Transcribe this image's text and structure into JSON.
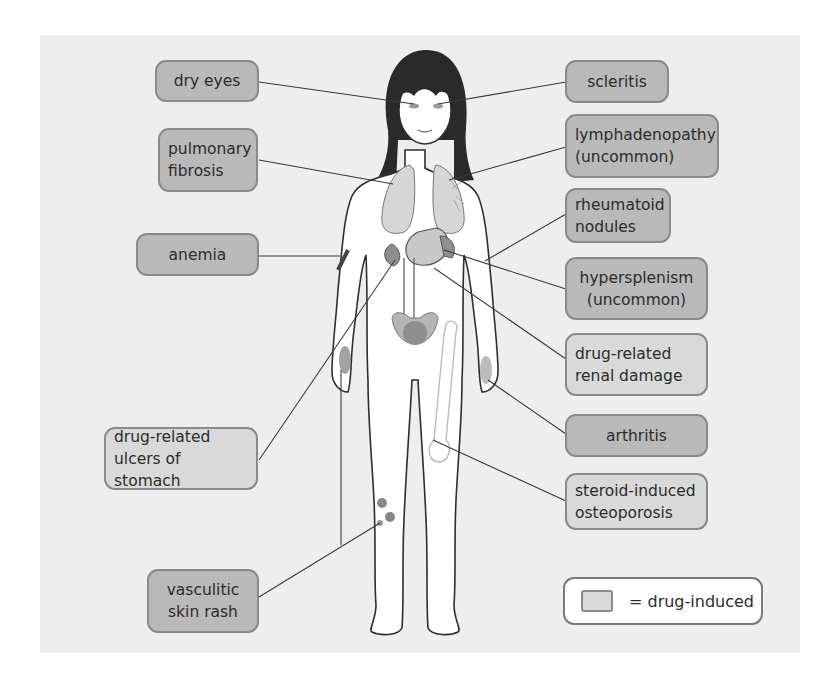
{
  "colors": {
    "background": "#ffffff",
    "panel": "#eeeeee",
    "disease_box": "#b9b9b9",
    "drug_induced_box": "#d9d9d9",
    "box_border": "#8a8a8a",
    "leader_line": "#3a3a3a",
    "organ_fill": "#c8c8c8",
    "organ_dark": "#8e8e8e",
    "hair": "#2a2a2a",
    "skin": "#ffffff"
  },
  "labels": {
    "dry_eyes": {
      "text": "dry eyes",
      "drug_induced": false
    },
    "pulmonary_fibrosis": {
      "text": "pulmonary\nfibrosis",
      "drug_induced": false
    },
    "anemia": {
      "text": "anemia",
      "drug_induced": false
    },
    "drug_related_ulcers": {
      "text": "drug-related\nulcers of stomach",
      "drug_induced": true
    },
    "vasculitic_skin_rash": {
      "text": "vasculitic\nskin rash",
      "drug_induced": false
    },
    "scleritis": {
      "text": "scleritis",
      "drug_induced": false
    },
    "lymphadenopathy": {
      "text": "lymphadenopathy\n(uncommon)",
      "drug_induced": false
    },
    "rheumatoid_nodules": {
      "text": "rheumatoid\nnodules",
      "drug_induced": false
    },
    "hypersplenism": {
      "text": "hypersplenism\n(uncommon)",
      "drug_induced": false
    },
    "drug_related_renal_damage": {
      "text": "drug-related\nrenal damage",
      "drug_induced": true
    },
    "arthritis": {
      "text": "arthritis",
      "drug_induced": false
    },
    "steroid_induced_osteoporosis": {
      "text": "steroid-induced\nosteoporosis",
      "drug_induced": true
    }
  },
  "legend": {
    "text": "= drug-induced"
  }
}
